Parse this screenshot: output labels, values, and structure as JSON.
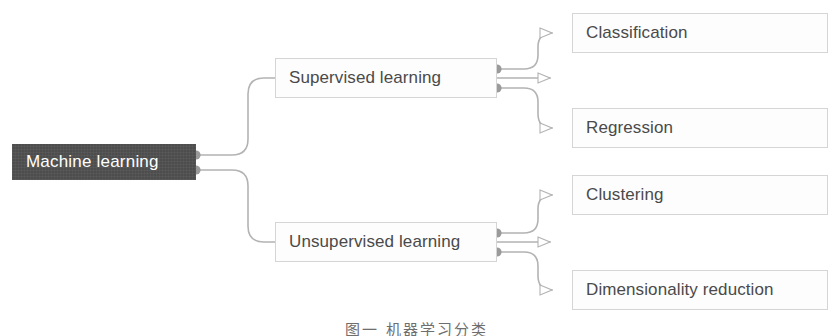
{
  "diagram": {
    "title_caption": "图一 机器学习分类",
    "colors": {
      "root_fill": "#4d4d4d",
      "root_text": "#ffffff",
      "box_fill": "#fdfdfd",
      "box_border": "#d5d5d5",
      "box_text": "#4a4a4a",
      "connector": "#b3b3b3",
      "anchor_dot": "#9a9a9a",
      "background": "#ffffff"
    },
    "nodes": [
      {
        "id": "root",
        "label": "Machine learning",
        "kind": "root",
        "x": 12,
        "y": 144,
        "w": 184,
        "h": 36
      },
      {
        "id": "supervised",
        "label": "Supervised learning",
        "kind": "box",
        "x": 275,
        "y": 58,
        "w": 222,
        "h": 40
      },
      {
        "id": "unsupervised",
        "label": "Unsupervised learning",
        "kind": "box",
        "x": 275,
        "y": 222,
        "w": 222,
        "h": 40
      },
      {
        "id": "classification",
        "label": "Classification",
        "kind": "box",
        "x": 572,
        "y": 13,
        "w": 256,
        "h": 40
      },
      {
        "id": "regression",
        "label": "Regression",
        "kind": "box",
        "x": 572,
        "y": 108,
        "w": 256,
        "h": 40
      },
      {
        "id": "clustering",
        "label": "Clustering",
        "kind": "box",
        "x": 572,
        "y": 175,
        "w": 256,
        "h": 40
      },
      {
        "id": "dimensionality",
        "label": "Dimensionality reduction",
        "kind": "box",
        "x": 572,
        "y": 270,
        "w": 256,
        "h": 40
      }
    ],
    "edges": [
      {
        "id": "root-supervised",
        "from": "root",
        "to": "supervised",
        "from_x": 196,
        "from_y": 155,
        "to_x": 275,
        "to_y": 78
      },
      {
        "id": "root-unsupervised",
        "from": "root",
        "to": "unsupervised",
        "from_x": 196,
        "from_y": 170,
        "to_x": 275,
        "to_y": 242
      },
      {
        "id": "supervised-classification",
        "from": "supervised",
        "to": "classification",
        "from_x": 497,
        "from_y": 69,
        "to_x": 572,
        "to_y": 33
      },
      {
        "id": "supervised-regression",
        "from": "supervised",
        "to": "regression",
        "from_x": 497,
        "from_y": 88,
        "to_x": 572,
        "to_y": 128
      },
      {
        "id": "unsupervised-clustering",
        "from": "unsupervised",
        "to": "clustering",
        "from_x": 497,
        "from_y": 233,
        "to_x": 572,
        "to_y": 195
      },
      {
        "id": "unsupervised-dimred",
        "from": "unsupervised",
        "to": "dimensionality",
        "from_x": 497,
        "from_y": 252,
        "to_x": 572,
        "to_y": 290
      }
    ]
  }
}
